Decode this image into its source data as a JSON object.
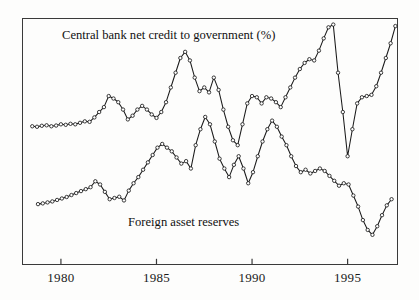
{
  "chart_data": {
    "type": "line",
    "title": "",
    "xlabel": "",
    "ylabel": "",
    "xlim": [
      1978.0,
      1997.6
    ],
    "ylim": [
      0,
      100
    ],
    "grid": false,
    "legend_position": "inline-annotation",
    "xticks": [
      1980,
      1985,
      1990,
      1995
    ],
    "xtick_labels": [
      "1980",
      "1985",
      "1990",
      "1995"
    ],
    "annotations": [
      {
        "text": "Central bank net credit to government (%)",
        "series": "Central bank net credit to government (%)"
      },
      {
        "text": "Foreign asset reserves",
        "series": "Foreign asset reserves"
      }
    ],
    "series": [
      {
        "name": "Central bank net credit to government (%)",
        "marker": "open-circle",
        "color": "#1a1a1a",
        "x": [
          1978.5,
          1978.75,
          1979.0,
          1979.25,
          1979.5,
          1979.75,
          1980.0,
          1980.25,
          1980.5,
          1980.75,
          1981.0,
          1981.25,
          1981.5,
          1981.75,
          1982.0,
          1982.25,
          1982.5,
          1982.75,
          1983.0,
          1983.25,
          1983.5,
          1983.75,
          1984.0,
          1984.25,
          1984.5,
          1984.75,
          1985.0,
          1985.25,
          1985.5,
          1985.75,
          1986.0,
          1986.25,
          1986.5,
          1986.75,
          1987.0,
          1987.25,
          1987.5,
          1987.75,
          1988.0,
          1988.25,
          1988.5,
          1988.75,
          1989.0,
          1989.25,
          1989.5,
          1989.75,
          1990.0,
          1990.25,
          1990.5,
          1990.75,
          1991.0,
          1991.25,
          1991.5,
          1991.75,
          1992.0,
          1992.25,
          1992.5,
          1992.75,
          1993.0,
          1993.25,
          1993.5,
          1993.75,
          1994.0,
          1994.25,
          1994.5,
          1994.75,
          1995.0,
          1995.25,
          1995.5,
          1995.75,
          1996.0,
          1996.25,
          1996.5,
          1996.75,
          1997.0,
          1997.25,
          1997.5
        ],
        "y": [
          56.2,
          56.0,
          56.4,
          56.6,
          56.2,
          56.5,
          57.0,
          56.8,
          57.2,
          57.0,
          57.6,
          58.2,
          58.0,
          59.8,
          62.0,
          64.0,
          68.5,
          67.5,
          66.0,
          63.0,
          59.0,
          60.5,
          63.0,
          64.5,
          63.0,
          61.0,
          59.6,
          62.0,
          66.0,
          72.0,
          78.0,
          84.0,
          86.5,
          83.0,
          76.0,
          70.5,
          72.0,
          70.0,
          76.0,
          71.0,
          63.0,
          56.0,
          50.5,
          48.5,
          57.0,
          65.5,
          68.5,
          68.0,
          65.5,
          68.0,
          67.5,
          66.0,
          64.0,
          68.0,
          72.0,
          76.0,
          79.5,
          82.0,
          83.5,
          83.0,
          87.0,
          92.0,
          96.5,
          97.6,
          78.0,
          62.0,
          44.0,
          55.0,
          65.5,
          68.0,
          68.5,
          69.0,
          72.5,
          78.0,
          84.0,
          90.0,
          97.0
        ]
      },
      {
        "name": "Foreign asset reserves",
        "marker": "open-circle",
        "color": "#1a1a1a",
        "x": [
          1978.8,
          1979.05,
          1979.3,
          1979.55,
          1979.8,
          1980.05,
          1980.3,
          1980.55,
          1980.8,
          1981.05,
          1981.3,
          1981.55,
          1981.8,
          1982.05,
          1982.3,
          1982.55,
          1982.8,
          1983.05,
          1983.3,
          1983.55,
          1983.8,
          1984.05,
          1984.3,
          1984.55,
          1984.8,
          1985.05,
          1985.3,
          1985.55,
          1985.8,
          1986.05,
          1986.3,
          1986.55,
          1986.8,
          1987.05,
          1987.3,
          1987.55,
          1987.8,
          1988.05,
          1988.3,
          1988.55,
          1988.8,
          1989.05,
          1989.3,
          1989.55,
          1989.8,
          1990.05,
          1990.3,
          1990.55,
          1990.8,
          1991.05,
          1991.3,
          1991.55,
          1991.8,
          1992.05,
          1992.3,
          1992.55,
          1992.8,
          1993.05,
          1993.3,
          1993.55,
          1993.8,
          1994.05,
          1994.3,
          1994.55,
          1994.8,
          1995.05,
          1995.3,
          1995.55,
          1995.8,
          1996.05,
          1996.3,
          1996.55,
          1996.8,
          1997.05,
          1997.3
        ],
        "y": [
          24.5,
          24.8,
          25.2,
          25.6,
          26.2,
          26.8,
          27.4,
          28.2,
          29.0,
          29.8,
          30.6,
          31.4,
          33.8,
          32.5,
          29.5,
          26.5,
          27.0,
          27.5,
          26.0,
          30.0,
          33.0,
          35.5,
          38.5,
          41.5,
          44.5,
          47.5,
          49.0,
          47.5,
          46.0,
          43.5,
          41.0,
          42.0,
          39.0,
          48.5,
          55.0,
          60.0,
          57.0,
          50.0,
          43.0,
          39.0,
          35.5,
          40.5,
          44.0,
          39.0,
          33.0,
          37.5,
          44.0,
          50.0,
          55.0,
          58.5,
          56.0,
          52.0,
          48.5,
          44.0,
          40.0,
          37.5,
          38.5,
          37.0,
          38.0,
          39.0,
          38.0,
          36.0,
          34.0,
          32.0,
          33.0,
          32.5,
          28.0,
          23.5,
          18.0,
          14.0,
          12.0,
          15.5,
          20.0,
          24.0,
          26.5
        ]
      }
    ]
  },
  "labels": {
    "top_series_label": "Central bank net credit to government (%)",
    "bottom_series_label": "Foreign asset reserves"
  },
  "axis": {
    "tick_labels": [
      "1980",
      "1985",
      "1990",
      "1995"
    ]
  },
  "colors": {
    "line": "#1a1a1a",
    "frame": "#3a3a3a",
    "background": "#fdfdfc",
    "text": "#111111"
  }
}
